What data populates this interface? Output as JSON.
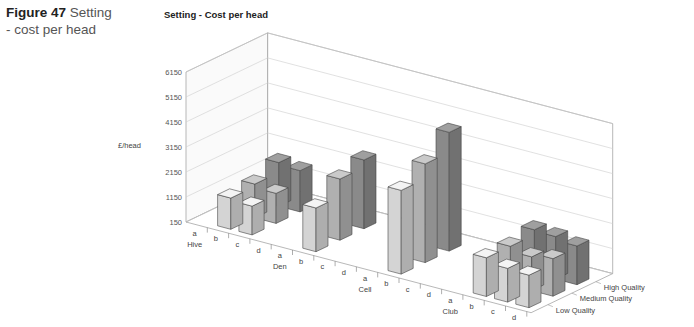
{
  "figure": {
    "number_label": "Figure 47",
    "caption_text": " Setting - cost per head"
  },
  "chart_data": {
    "type": "bar",
    "subtype": "3d-bar",
    "title": "Setting - Cost per head",
    "ylabel": "£/head",
    "xlabel": "",
    "ylim": [
      150,
      6150
    ],
    "y_ticks": [
      "150",
      "1150",
      "2150",
      "3150",
      "4150",
      "5150",
      "6150"
    ],
    "groups": [
      "Hive",
      "Den",
      "Cell",
      "Club"
    ],
    "sub_categories": [
      "a",
      "b",
      "c",
      "d"
    ],
    "categories": [
      "Hive a",
      "Hive b",
      "Hive c",
      "Hive d",
      "Den a",
      "Den b",
      "Den c",
      "Den d",
      "Cell a",
      "Cell b",
      "Cell c",
      "Cell d",
      "Club a",
      "Club b",
      "Club c",
      "Club d"
    ],
    "series": [
      {
        "name": "Low Quality",
        "color": "#d4d4d4",
        "values": [
          null,
          1400,
          1300,
          null,
          null,
          1900,
          null,
          null,
          null,
          3500,
          null,
          null,
          null,
          1700,
          1500,
          1450
        ]
      },
      {
        "name": "Medium Quality",
        "color": "#b0b0b0",
        "values": [
          null,
          1500,
          1350,
          null,
          null,
          2600,
          null,
          null,
          null,
          4100,
          null,
          null,
          null,
          1700,
          1500,
          1650
        ]
      },
      {
        "name": "High Quality",
        "color": "#8a8a8a",
        "values": [
          null,
          1900,
          1800,
          null,
          null,
          2900,
          null,
          null,
          null,
          4900,
          null,
          null,
          null,
          1900,
          1850,
          1700
        ]
      }
    ],
    "legend": [
      "Low Quality",
      "Medium Quality",
      "High Quality"
    ],
    "legend_position": "depth-axis-right",
    "grid": true
  }
}
